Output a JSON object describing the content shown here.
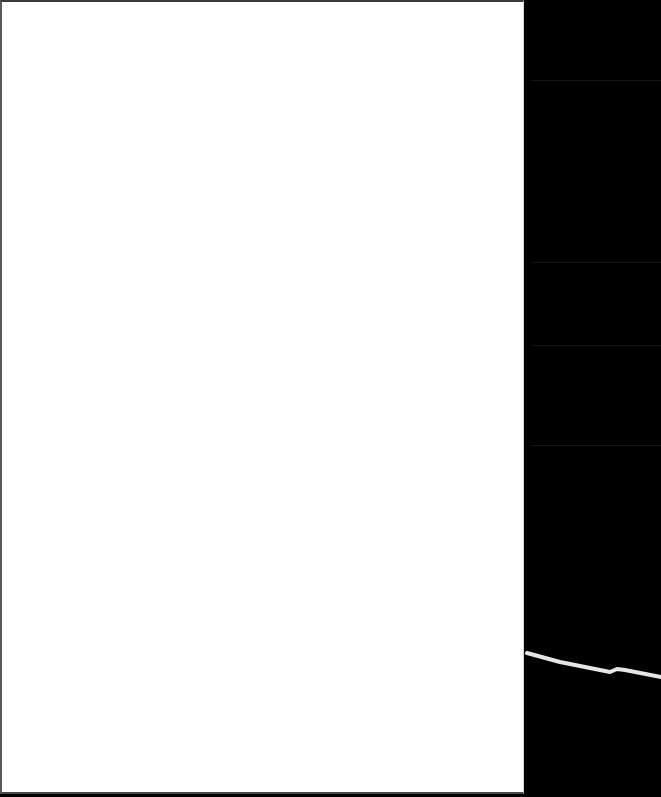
{
  "scene": {
    "description": "Blank white page beside a dark panel with a light wavy stroke",
    "colors": {
      "page": "#ffffff",
      "page_border": "#4a4a4a",
      "dark_panel": "#000000",
      "faint_lines": "#141414",
      "stroke": "#e6e6e6"
    },
    "dark_panel_faint_lines_y": [
      80,
      262,
      345,
      445
    ],
    "stroke_points": [
      [
        2,
        653
      ],
      [
        35,
        662
      ],
      [
        65,
        668
      ],
      [
        85,
        672
      ],
      [
        92,
        669
      ],
      [
        100,
        670
      ],
      [
        136,
        677
      ]
    ]
  }
}
